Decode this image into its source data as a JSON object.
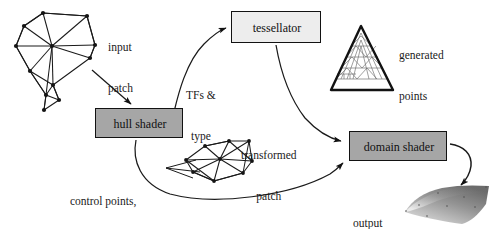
{
  "figure": {
    "background_color": "#ffffff",
    "line_color": "#1a1a1a"
  },
  "stages": [
    {
      "id": "hull-shader",
      "label": "hull shader",
      "fill_color": "#a6a6a6",
      "border_color": "#121212",
      "x": 95,
      "y": 108,
      "width": 88,
      "height": 30
    },
    {
      "id": "tessellator",
      "label": "tessellator",
      "fill_color": "#ededed",
      "border_color": "#121212",
      "x": 231,
      "y": 11,
      "width": 90,
      "height": 32
    },
    {
      "id": "domain-shader",
      "label": "domain shader",
      "fill_color": "#a6a6a6",
      "border_color": "#121212",
      "x": 349,
      "y": 131,
      "width": 98,
      "height": 30
    }
  ],
  "labels": [
    {
      "id": "input-patch",
      "line1": "input",
      "line2": "patch",
      "x": 108,
      "y": 14
    },
    {
      "id": "tfs-and-type",
      "line1": "TFs &",
      "line2": "type",
      "x": 186,
      "y": 62
    },
    {
      "id": "generated-points",
      "line1": "generated",
      "line2": "points",
      "x": 399,
      "y": 22
    },
    {
      "id": "transformed-patch",
      "line1": "transformed",
      "line2": "patch",
      "x": 241,
      "y": 122
    },
    {
      "id": "control-points",
      "line1": "control points,",
      "line2": "TFs, & constants",
      "x": 64,
      "y": 168
    },
    {
      "id": "output-mesh",
      "line1": "output",
      "line2": "mesh",
      "x": 353,
      "y": 190
    }
  ],
  "graphics": {
    "input_patch_mesh": {
      "name": "input-patch-mesh",
      "description": "irregular triangulated polygon mesh of the input control patch",
      "vertex_count": 12,
      "vertices": [
        [
          43,
          13
        ],
        [
          24,
          26
        ],
        [
          87,
          16
        ],
        [
          16,
          46
        ],
        [
          52,
          46
        ],
        [
          95,
          45
        ],
        [
          90,
          58
        ],
        [
          30,
          71
        ],
        [
          46,
          95
        ],
        [
          44,
          110
        ],
        [
          59,
          100
        ],
        [
          53,
          85
        ]
      ]
    },
    "generated_points_triangle": {
      "name": "generated-points-triangle",
      "description": "tessellated equilateral triangle domain with inner subdivision rings",
      "apex": [
        361,
        26
      ],
      "bottom_left": [
        331,
        90
      ],
      "bottom_right": [
        393,
        90
      ]
    },
    "transformed_patch_mesh": {
      "name": "transformed-patch-mesh",
      "description": "triangulated quadrilateral patch after hull shader transform",
      "vertices": [
        [
          186,
          160
        ],
        [
          205,
          146
        ],
        [
          229,
          141
        ],
        [
          249,
          141
        ],
        [
          252,
          161
        ],
        [
          243,
          173
        ],
        [
          214,
          181
        ],
        [
          193,
          172
        ],
        [
          220,
          159
        ]
      ]
    },
    "output_mesh": {
      "name": "output-mesh",
      "description": "shaded curved surface patch rendered from the tessellated domain",
      "fill_gradient_from": "#6f6f6f",
      "fill_gradient_to": "#d8d8d8"
    }
  },
  "arrows": [
    {
      "id": "arrow-input-to-hull",
      "type": "straight",
      "from": "input-patch-mesh",
      "to": "hull-shader"
    },
    {
      "id": "arrow-hull-to-tessellator",
      "type": "curved",
      "from": "hull-shader",
      "to": "tessellator",
      "annotation": "TFs & type"
    },
    {
      "id": "arrow-tessellator-to-domain",
      "type": "curved",
      "from": "tessellator",
      "to": "domain-shader",
      "annotation": "generated points"
    },
    {
      "id": "arrow-hull-to-domain",
      "type": "curved",
      "from": "hull-shader",
      "to": "domain-shader",
      "annotation": "control points, TFs, & constants"
    },
    {
      "id": "arrow-hull-to-patch",
      "type": "curved",
      "from": "hull-shader",
      "to": "transformed-patch-mesh"
    },
    {
      "id": "arrow-domain-to-output",
      "type": "curved",
      "from": "domain-shader",
      "to": "output-mesh"
    }
  ]
}
